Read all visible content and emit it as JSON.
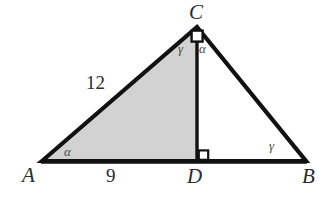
{
  "figure": {
    "type": "geometry-diagram",
    "width": 327,
    "height": 199,
    "background_color": "#ffffff",
    "stroke_color": "#111111",
    "shaded_fill_color": "#d2d2d2",
    "unshaded_fill_color": "#ffffff"
  },
  "points": {
    "A": {
      "label": "A",
      "x": 42,
      "y": 161
    },
    "B": {
      "label": "B",
      "x": 306,
      "y": 161
    },
    "C": {
      "label": "C",
      "x": 197,
      "y": 27
    },
    "D": {
      "label": "D",
      "x": 197,
      "y": 161
    }
  },
  "vertex_labels": [
    {
      "name": "vertex-label-c",
      "text": "C",
      "left": 189,
      "top": 2
    },
    {
      "name": "vertex-label-a",
      "text": "A",
      "left": 22,
      "top": 165
    },
    {
      "name": "vertex-label-d",
      "text": "D",
      "left": 187,
      "top": 166
    },
    {
      "name": "vertex-label-b",
      "text": "B",
      "left": 302,
      "top": 166
    }
  ],
  "measurements": [
    {
      "name": "side-ac-length",
      "text": "12",
      "segment": "AC",
      "left": 86,
      "top": 73
    },
    {
      "name": "side-ad-length",
      "text": "9",
      "segment": "AD",
      "left": 106,
      "top": 166
    }
  ],
  "angle_labels": [
    {
      "name": "angle-a-alpha",
      "text": "α",
      "at": "A",
      "left": 64,
      "top": 145
    },
    {
      "name": "angle-acd-gamma",
      "text": "γ",
      "at": "C",
      "left": 178,
      "top": 42
    },
    {
      "name": "angle-bcd-alpha",
      "text": "α",
      "at": "C",
      "left": 199,
      "top": 42
    },
    {
      "name": "angle-b-gamma",
      "text": "γ",
      "at": "B",
      "left": 269,
      "top": 139
    }
  ],
  "right_angle_markers": [
    {
      "name": "right-angle-marker-c",
      "at": "C",
      "style": "diamond"
    },
    {
      "name": "right-angle-marker-d",
      "at": "D",
      "style": "square"
    }
  ],
  "shapes": {
    "shaded_triangle": {
      "name": "triangle-acd-shaded",
      "vertices": "A,C,D",
      "filled": true
    },
    "open_triangle": {
      "name": "triangle-cdb-open",
      "vertices": "C,D,B",
      "filled": false
    },
    "altitude": {
      "name": "altitude-cd",
      "from": "C",
      "to": "D"
    }
  }
}
